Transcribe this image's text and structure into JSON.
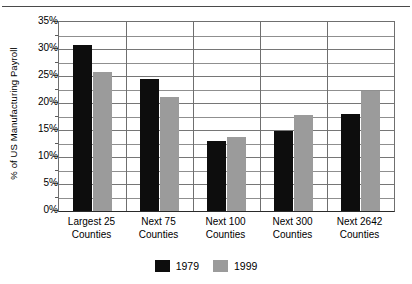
{
  "chart_data": {
    "type": "bar",
    "title": "",
    "xlabel": "",
    "ylabel": "% of US Manufacturing Payroll",
    "categories": [
      "Largest 25 Counties",
      "Next 75 Counties",
      "Next 100 Counties",
      "Next 300 Counties",
      "Next 2642 Counties"
    ],
    "category_lines": [
      [
        "Largest 25",
        "Counties"
      ],
      [
        "Next 75",
        "Counties"
      ],
      [
        "Next 100",
        "Counties"
      ],
      [
        "Next 300",
        "Counties"
      ],
      [
        "Next 2642",
        "Counties"
      ]
    ],
    "series": [
      {
        "name": "1979",
        "color": "#0d0d0d",
        "values": [
          30.7,
          24.4,
          13.0,
          14.9,
          18.0
        ]
      },
      {
        "name": "1999",
        "color": "#9b9b9b",
        "values": [
          25.7,
          21.2,
          13.7,
          17.8,
          22.3
        ]
      }
    ],
    "ylim": [
      0,
      35
    ],
    "ytick_values": [
      0,
      5,
      10,
      15,
      20,
      25,
      30,
      35
    ],
    "ytick_labels": [
      "0%",
      "5%",
      "10%",
      "15%",
      "20%",
      "25%",
      "30%",
      "35%"
    ],
    "yminor_values": [
      2.5,
      7.5,
      12.5,
      17.5,
      22.5,
      27.5,
      32.5
    ],
    "grid": true,
    "legend_position": "bottom"
  },
  "legend": {
    "entries": [
      {
        "label": "1979",
        "color": "#0d0d0d"
      },
      {
        "label": "1999",
        "color": "#9b9b9b"
      }
    ]
  },
  "yaxis": {
    "caption": "% of US Manufacturing Payroll"
  },
  "title_remnant": ""
}
